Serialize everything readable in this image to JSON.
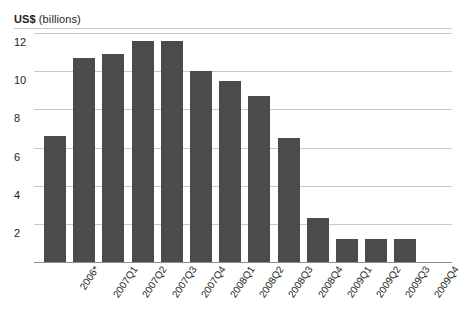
{
  "chart_data": {
    "type": "bar",
    "title": "US$ (billions)",
    "title_bold_part": "US$",
    "title_rest_part": " (billions)",
    "xlabel": "",
    "ylabel": "US$ (billions)",
    "categories": [
      "2006*",
      "2007Q1",
      "2007Q2",
      "2007Q3",
      "2007Q4",
      "2008Q1",
      "2008Q2",
      "2008Q3",
      "2008Q4",
      "2009Q1",
      "2009Q2",
      "2009Q3",
      "2009Q4"
    ],
    "values": [
      6.6,
      10.7,
      10.9,
      11.6,
      11.6,
      10.0,
      9.5,
      8.7,
      6.5,
      2.3,
      1.2,
      1.2,
      1.2
    ],
    "ylim": [
      0,
      12
    ],
    "yticks": [
      12,
      10,
      8,
      6,
      4,
      2
    ],
    "ytick_labels": [
      "12",
      "10",
      "8",
      "6",
      "4",
      "2"
    ],
    "grid": true,
    "legend": false,
    "legend_position": "none",
    "series": [
      {
        "name": "US$ (billions)",
        "color": "#4b4b4b",
        "values": [
          6.6,
          10.7,
          10.9,
          11.6,
          11.6,
          10.0,
          9.5,
          8.7,
          6.5,
          2.3,
          1.2,
          1.2,
          1.2
        ]
      }
    ],
    "annotations": [
      "* 2006 figure marked with asterisk"
    ],
    "colors": {
      "bar": "#4b4b4b",
      "grid": "#c9c9c9",
      "axis": "#8d8d8d",
      "text": "#231f20",
      "background": "#ffffff"
    }
  }
}
